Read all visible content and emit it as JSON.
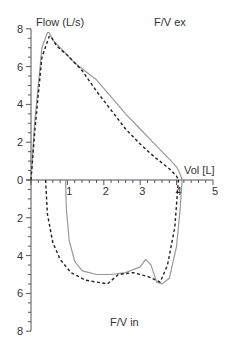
{
  "chart_data": {
    "type": "line",
    "title_top": "F/V ex",
    "title_bottom": "F/V in",
    "ylabel": "Flow (L/s)",
    "xlabel": "Vol [L]",
    "xlim": [
      0,
      5
    ],
    "ylim_expiratory": [
      0,
      8
    ],
    "ylim_inspiratory": [
      0,
      8
    ],
    "x_ticks": [
      1,
      2,
      3,
      4,
      5
    ],
    "y_ticks_top": [
      0,
      2,
      4,
      6,
      8
    ],
    "y_ticks_bottom": [
      2,
      4,
      6,
      8
    ],
    "grid": false,
    "legend": null,
    "series": [
      {
        "name": "solid",
        "style": "solid",
        "color": "#999999",
        "expiratory": {
          "x": [
            0.0,
            0.1,
            0.3,
            0.45,
            0.5,
            0.6,
            0.8,
            1.2,
            1.6,
            1.8,
            2.2,
            2.6,
            3.0,
            3.4,
            3.8,
            4.0,
            4.1,
            4.15
          ],
          "y": [
            0.0,
            3.0,
            7.0,
            7.8,
            7.8,
            7.4,
            7.0,
            6.2,
            5.6,
            5.3,
            4.4,
            3.5,
            2.7,
            1.9,
            1.1,
            0.7,
            0.3,
            0.0
          ]
        },
        "inspiratory": {
          "x": [
            0.95,
            0.97,
            1.05,
            1.2,
            1.4,
            1.6,
            1.8,
            2.2,
            2.6,
            3.0,
            3.15,
            3.3,
            3.45,
            3.6,
            3.8,
            4.0,
            4.1,
            4.15
          ],
          "y": [
            0.0,
            1.5,
            3.2,
            4.3,
            4.8,
            4.9,
            5.0,
            5.0,
            4.9,
            4.6,
            4.2,
            4.5,
            5.4,
            5.5,
            5.2,
            3.5,
            1.5,
            0.0
          ]
        }
      },
      {
        "name": "dashed",
        "style": "dashed",
        "color": "#222222",
        "expiratory": {
          "x": [
            0.0,
            0.1,
            0.3,
            0.5,
            0.55,
            0.7,
            1.0,
            1.4,
            1.8,
            2.2,
            2.6,
            3.0,
            3.4,
            3.8,
            4.0,
            4.05
          ],
          "y": [
            0.0,
            2.5,
            6.5,
            7.6,
            7.6,
            7.1,
            6.6,
            5.8,
            4.7,
            3.7,
            2.7,
            1.9,
            1.2,
            0.6,
            0.2,
            0.0
          ]
        },
        "inspiratory": {
          "x": [
            0.4,
            0.45,
            0.6,
            0.8,
            1.1,
            1.5,
            2.1,
            2.4,
            2.8,
            3.2,
            3.55,
            3.75,
            3.95,
            4.05
          ],
          "y": [
            0.0,
            1.8,
            3.3,
            4.2,
            4.9,
            5.3,
            5.5,
            5.0,
            4.9,
            5.1,
            5.4,
            4.5,
            2.5,
            0.0
          ]
        }
      }
    ]
  }
}
